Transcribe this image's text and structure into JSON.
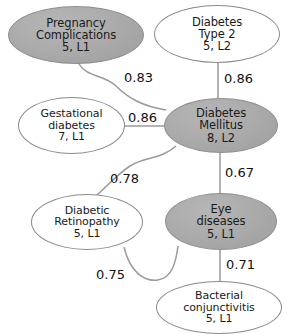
{
  "diagram": {
    "type": "node-link-graph",
    "background_color": "#ffffff",
    "shaded_node_color": "#ababab",
    "plain_node_color": "#ffffff",
    "edge_color": "#9a9a9a",
    "text_color": "#1a1a1a"
  },
  "nodes": [
    {
      "id": "pregnancy-complications",
      "name": "Pregnancy Complications",
      "line1": "Pregnancy",
      "line2": "Complications",
      "line3": "5, L1",
      "count": "5",
      "level": "L1",
      "style": "shaded"
    },
    {
      "id": "diabetes-type-2",
      "name": "Diabetes Type 2",
      "line1": "Diabetes",
      "line2": "Type 2",
      "line3": "5, L2",
      "count": "5",
      "level": "L2",
      "style": "plain"
    },
    {
      "id": "gestational-diabetes",
      "name": "Gestational diabetes",
      "line1": "Gestational",
      "line2": "diabetes",
      "line3": "7, L1",
      "count": "7",
      "level": "L1",
      "style": "plain"
    },
    {
      "id": "diabetes-mellitus",
      "name": "Diabetes Mellitus",
      "line1": "Diabetes",
      "line2": "Mellitus",
      "line3": "8, L2",
      "count": "8",
      "level": "L2",
      "style": "shaded"
    },
    {
      "id": "diabetic-retinopathy",
      "name": "Diabetic Retinopathy",
      "line1": "Diabetic",
      "line2": "Retinopathy",
      "line3": "5, L1",
      "count": "5",
      "level": "L1",
      "style": "plain"
    },
    {
      "id": "eye-diseases",
      "name": "Eye diseases",
      "line1": "Eye",
      "line2": "diseases",
      "line3": "5, L1",
      "count": "5",
      "level": "L1",
      "style": "shaded"
    },
    {
      "id": "bacterial-conjunctivitis",
      "name": "Bacterial conjunctivitis",
      "line1": "Bacterial",
      "line2": "conjunctivitis",
      "line3": "5, L1",
      "count": "5",
      "level": "L1",
      "style": "plain"
    }
  ],
  "edges": [
    {
      "id": "edge-pregnancy-mellitus",
      "source": "pregnancy-complications",
      "target": "diabetes-mellitus",
      "weight": "0.83"
    },
    {
      "id": "edge-type2-mellitus",
      "source": "diabetes-type-2",
      "target": "diabetes-mellitus",
      "weight": "0.86"
    },
    {
      "id": "edge-gestational-mellitus",
      "source": "gestational-diabetes",
      "target": "diabetes-mellitus",
      "weight": "0.86"
    },
    {
      "id": "edge-mellitus-retinopathy",
      "source": "diabetes-mellitus",
      "target": "diabetic-retinopathy",
      "weight": "0.78"
    },
    {
      "id": "edge-mellitus-eye",
      "source": "diabetes-mellitus",
      "target": "eye-diseases",
      "weight": "0.67"
    },
    {
      "id": "edge-retinopathy-eye",
      "source": "diabetic-retinopathy",
      "target": "eye-diseases",
      "weight": "0.75"
    },
    {
      "id": "edge-eye-conjunctivitis",
      "source": "eye-diseases",
      "target": "bacterial-conjunctivitis",
      "weight": "0.71"
    }
  ]
}
